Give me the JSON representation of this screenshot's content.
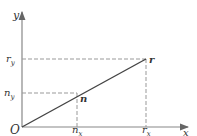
{
  "diagram": {
    "type": "vector-projection",
    "axes": {
      "x_label": "x",
      "y_label": "y",
      "origin_label": "O"
    },
    "vectors": [
      {
        "name": "r",
        "label": "r",
        "x_label": "r",
        "x_sub": "x",
        "y_label": "r",
        "y_sub": "y"
      },
      {
        "name": "n",
        "label": "n",
        "x_label": "n",
        "x_sub": "x",
        "y_label": "n",
        "y_sub": "y"
      }
    ],
    "colors": {
      "axis": "#777777",
      "vector": "#444444",
      "dashed": "#888888",
      "text": "#333333"
    }
  }
}
